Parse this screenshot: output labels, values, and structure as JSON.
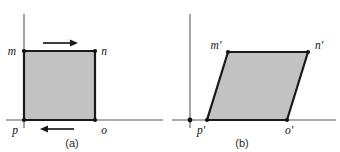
{
  "figure": {
    "title": "",
    "background_color": "#ffffff",
    "fill_color": "#c2c2c2",
    "outline_color": "#1a1a1a",
    "axis_color": "#8f8f8f",
    "panels": [
      {
        "id": "a",
        "caption": "(a)",
        "shape": "square",
        "vertices": [
          {
            "name": "m",
            "label": "m",
            "x": 24,
            "y": 51
          },
          {
            "name": "n",
            "label": "n",
            "x": 95,
            "y": 51
          },
          {
            "name": "o",
            "label": "o",
            "x": 95,
            "y": 120
          },
          {
            "name": "p",
            "label": "p",
            "x": 24,
            "y": 120
          }
        ],
        "arrows": [
          {
            "name": "top-arrow",
            "direction": "right"
          },
          {
            "name": "bottom-arrow",
            "direction": "left"
          }
        ]
      },
      {
        "id": "b",
        "caption": "(b)",
        "shape": "parallelogram",
        "vertices": [
          {
            "name": "m-prime",
            "label": "m'",
            "x": 228,
            "y": 52
          },
          {
            "name": "n-prime",
            "label": "n'",
            "x": 308,
            "y": 52
          },
          {
            "name": "o-prime",
            "label": "o'",
            "x": 287,
            "y": 120
          },
          {
            "name": "p-prime",
            "label": "p'",
            "x": 207,
            "y": 120
          }
        ],
        "arrows": []
      }
    ]
  }
}
